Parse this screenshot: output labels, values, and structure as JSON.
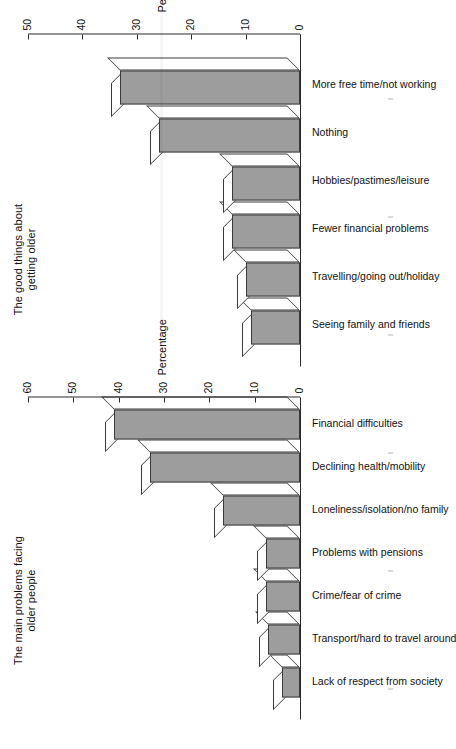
{
  "page": {
    "orientation": "rotated-90-ccw",
    "background_color": "#ffffff",
    "bar_fill_color": "#9d9d9d",
    "bar_line_color": "#3a3a3a",
    "bar_top_color": "#ffffff"
  },
  "chart_data": [
    {
      "id": "main-problems",
      "type": "bar",
      "title": "The main problems facing\nolder people",
      "xlabel": "",
      "ylabel": "Percentage",
      "ylim": [
        0,
        60
      ],
      "yticks": [
        0,
        10,
        20,
        30,
        40,
        50,
        60
      ],
      "ytick_labels": [
        "0",
        "10",
        "20",
        "30",
        "40",
        "50",
        "60"
      ],
      "grid": false,
      "legend": "none",
      "style": "3d-bar",
      "categories": [
        "Lack of respect from society",
        "Transport/hard to travel around",
        "Crime/fear of crime",
        "Problems with pensions",
        "Loneliness/isolation/no family",
        "Declining health/mobility",
        "Financial difficulties"
      ],
      "values": [
        4,
        7,
        7.5,
        7.5,
        17,
        33,
        41
      ]
    },
    {
      "id": "good-things",
      "type": "bar",
      "title": "The good things about\ngetting older",
      "xlabel": "",
      "ylabel": "Percentage",
      "ylim": [
        0,
        50
      ],
      "yticks": [
        0,
        10,
        20,
        30,
        40,
        50
      ],
      "ytick_labels": [
        "0",
        "10",
        "20",
        "30",
        "40",
        "50"
      ],
      "grid": false,
      "legend": "none",
      "style": "3d-bar",
      "categories": [
        "Seeing family and friends",
        "Travelling/going out/holiday",
        "Fewer financial problems",
        "Hobbies/pastimes/leisure",
        "Nothing",
        "More free time/not working"
      ],
      "values": [
        9,
        10,
        12.5,
        12.5,
        26,
        33
      ]
    }
  ]
}
